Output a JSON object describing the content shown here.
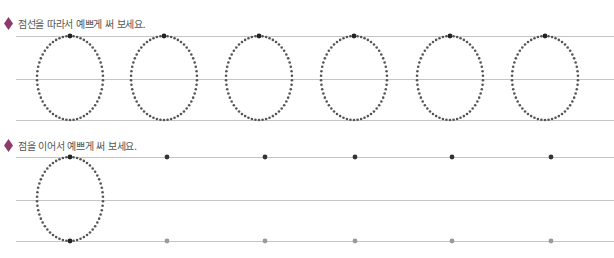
{
  "header_faint_text": "",
  "section1": {
    "instruction": "점선을 따라서 예쁘게 써 보세요.",
    "letter": "ㅇ",
    "line_y": [
      36,
      79,
      120
    ],
    "oval_centers_x": [
      70,
      164,
      259,
      354,
      450,
      545
    ],
    "oval_rx": 33,
    "oval_cy": 78,
    "oval_ry": 42
  },
  "section2": {
    "instruction": "점을 이어서 예쁘게 써 보세요.",
    "line_y": [
      157,
      200,
      241
    ],
    "example_oval": {
      "cx": 70,
      "cy": 199,
      "rx": 33,
      "ry": 42
    },
    "start_dots_x": [
      167,
      265,
      355,
      452,
      551
    ],
    "start_dot_color": "#333333",
    "end_dot_color": "#9a9a9a"
  },
  "colors": {
    "diamond": "#8c3b6b",
    "dotted_path": "#555555",
    "start_dot": "#222222",
    "guide_line": "#c4c4c4",
    "instruction_text": "#555555"
  }
}
